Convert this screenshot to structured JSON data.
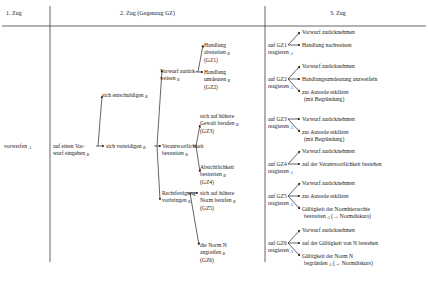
{
  "headers": {
    "col1": "1. Zug",
    "col2": "2. Zug (Gegenzug GZ)",
    "col3": "3. Zug"
  },
  "col1": {
    "root": "vorwerfen",
    "root_sub": "A"
  },
  "col2": {
    "level1": {
      "line1": "auf einen Vor-",
      "line2": "wurf eingehen",
      "sub": "B"
    },
    "entschuldigen": {
      "label": "sich entschuldigen",
      "sub": "B"
    },
    "verteidigen": {
      "label": "sich verteidigen",
      "sub": "B"
    },
    "vorwurf_zurueck": {
      "line1": "Vorwurf zurück-",
      "line2": "weisen",
      "sub": "B"
    },
    "verantwortlichkeit": {
      "line1": "Verantwortlichkeit",
      "line2": "bestreiten",
      "sub": "B"
    },
    "rechtfertigung": {
      "line1": "Rechtfertigung",
      "line2": "vorbringen",
      "sub": "B"
    },
    "gz1": {
      "line1": "Handlung",
      "line2": "abstreiten",
      "sub": "B",
      "tag": "(GZ1)"
    },
    "gz2": {
      "line1": "Handlung",
      "line2": "umdeuten",
      "sub": "B",
      "tag": "(GZ2)"
    },
    "gz3": {
      "line1": "sich auf höhere",
      "line2": "Gewalt berufen",
      "sub": "B",
      "tag": "(GZ3)"
    },
    "gz4": {
      "line1": "Absichtlichkeit",
      "line2": "bestreiten",
      "sub": "B",
      "tag": "(GZ4)"
    },
    "gz5": {
      "line1": "sich auf höhere",
      "line2": "Norm berufen",
      "sub": "B",
      "tag": "(GZ5)"
    },
    "gz6": {
      "line1": "die Norm N",
      "line2": "angreifen",
      "sub": "B",
      "tag": "(GZ6)"
    }
  },
  "col3": {
    "groups": [
      {
        "react": "auf GZ1",
        "react2": "reagieren",
        "sub": "A",
        "options": [
          "Vorwurf zurücknehmen",
          "Handlung nachweisen"
        ]
      },
      {
        "react": "auf GZ2",
        "react2": "reagieren",
        "sub": "A",
        "options": [
          "Vorwurf zurücknehmen",
          "Handlungsumdeutung anzweifeln",
          "zur Ausrede erklären",
          "(mit Begründung)"
        ]
      },
      {
        "react": "auf GZ3",
        "react2": "reagieren",
        "sub": "A",
        "options": [
          "Vorwurf zurücknehmen",
          "zur Ausrede erklären",
          "(mit Begründung)"
        ]
      },
      {
        "react": "auf GZ4",
        "react2": "reagieren",
        "sub": "A",
        "options": [
          "Vorwurf zurücknehmen",
          "auf der Verantwortlichkeit bestehen"
        ]
      },
      {
        "react": "auf GZ5",
        "react2": "reagieren",
        "sub": "A",
        "options": [
          "Vorwurf zurücknehmen",
          "zur Ausrede erklären",
          "Gültigkeit der Normhierarchie",
          "bestreiten",
          "(→ Normdiskurs)"
        ]
      },
      {
        "react": "auf GZ6",
        "react2": "reagieren",
        "sub": "A",
        "options": [
          "Vorwurf zurücknehmen",
          "auf der Gültigkeit von N bestehen",
          "Gültigkeit der Norm N",
          "begründen",
          "(→ Normdiskurs)"
        ]
      }
    ]
  }
}
